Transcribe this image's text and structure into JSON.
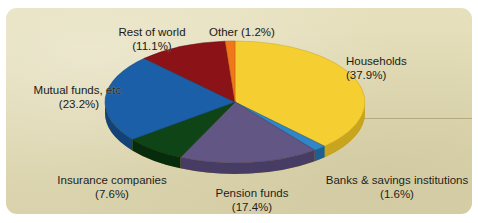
{
  "panel": {
    "background_color": "#e3dcb4",
    "border_radius": "11px"
  },
  "chart_data": {
    "type": "pie",
    "title": "",
    "subtitle": "",
    "xlabel": "",
    "ylabel": "",
    "legend_position": "labels-around-pie",
    "grid": false,
    "three_d": true,
    "units": "percent",
    "total": 100.0,
    "categories": [
      "Households",
      "Banks & savings institutions",
      "Pension funds",
      "Insurance companies",
      "Mutual funds, etc.",
      "Rest of world",
      "Other"
    ],
    "values": [
      37.9,
      1.6,
      17.4,
      7.6,
      23.2,
      11.1,
      1.2
    ],
    "colors": [
      "#f5ce32",
      "#2f86c8",
      "#625685",
      "#0e4416",
      "#1a5fa8",
      "#8b1216",
      "#f07818"
    ],
    "slices": [
      {
        "label": "Households",
        "value": 37.9,
        "value_text": "(37.9%)",
        "color": "#f5ce32",
        "side_color": "#c9a41e"
      },
      {
        "label": "Banks & savings institutions",
        "value": 1.6,
        "value_text": "(1.6%)",
        "color": "#2f86c8",
        "side_color": "#1e5f93"
      },
      {
        "label": "Pension funds",
        "value": 17.4,
        "value_text": "(17.4%)",
        "color": "#625685",
        "side_color": "#473c63"
      },
      {
        "label": "Insurance companies",
        "value": 7.6,
        "value_text": "(7.6%)",
        "color": "#0e4416",
        "side_color": "#072c0d"
      },
      {
        "label": "Mutual funds, etc.",
        "value": 23.2,
        "value_text": "(23.2%)",
        "color": "#1a5fa8",
        "side_color": "#124277"
      },
      {
        "label": "Rest of world",
        "value": 11.1,
        "value_text": "(11.1%)",
        "color": "#8b1216",
        "side_color": "#5e0b0e"
      },
      {
        "label": "Other",
        "value": 1.2,
        "value_text": "(1.2%)",
        "color": "#f07818",
        "side_color": "#b4540c"
      }
    ]
  },
  "labels": {
    "rest_of_world": {
      "name": "Rest of world",
      "value": "(11.1%)"
    },
    "other": {
      "name": "Other (1.2%)",
      "value": ""
    },
    "households": {
      "name": "Households",
      "value": "(37.9%)"
    },
    "mutual_funds": {
      "name": "Mutual funds, etc.",
      "value": "(23.2%)"
    },
    "banks": {
      "name": "Banks & savings institutions",
      "value": "(1.6%)"
    },
    "pension_funds": {
      "name": "Pension funds",
      "value": "(17.4%)"
    },
    "insurance": {
      "name": "Insurance companies",
      "value": "(7.6%)"
    }
  }
}
